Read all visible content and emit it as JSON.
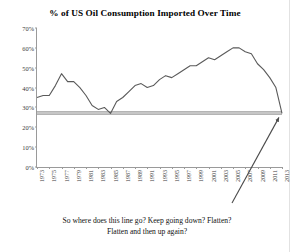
{
  "chart_data": {
    "type": "line",
    "title": "% of US Oil Consumption Imported Over Time",
    "xlabel": "",
    "ylabel": "",
    "ylim": [
      0,
      70
    ],
    "yticks": [
      0,
      10,
      20,
      30,
      40,
      50,
      60,
      70
    ],
    "ytick_labels": [
      "0%",
      "10%",
      "20%",
      "30%",
      "40%",
      "50%",
      "60%",
      "70%"
    ],
    "xlim": [
      1973,
      2013
    ],
    "xticks": [
      1973,
      1975,
      1977,
      1979,
      1981,
      1983,
      1985,
      1987,
      1989,
      1991,
      1993,
      1995,
      1997,
      1999,
      2001,
      2003,
      2005,
      2007,
      2009,
      2011,
      2013
    ],
    "xtick_labels": [
      "1973",
      "1975",
      "1977",
      "1979",
      "1981",
      "1983",
      "1985",
      "1987",
      "1989",
      "1991",
      "1993",
      "1995",
      "1997",
      "1999",
      "2001",
      "2003",
      "2005",
      "2007",
      "2009",
      "2011",
      "2013"
    ],
    "grid": false,
    "legend": "none",
    "series_color": "#5a5a5a",
    "x": [
      1973,
      1974,
      1975,
      1976,
      1977,
      1978,
      1979,
      1980,
      1981,
      1982,
      1983,
      1984,
      1985,
      1986,
      1987,
      1988,
      1989,
      1990,
      1991,
      1992,
      1993,
      1994,
      1995,
      1996,
      1997,
      1998,
      1999,
      2000,
      2001,
      2002,
      2003,
      2004,
      2005,
      2006,
      2007,
      2008,
      2009,
      2010,
      2011,
      2012,
      2013
    ],
    "values": [
      35,
      36,
      36,
      41,
      47,
      43,
      43,
      40,
      36,
      31,
      29,
      30,
      27,
      33,
      35,
      38,
      41,
      42,
      40,
      41,
      44,
      46,
      45,
      47,
      49,
      51,
      51,
      53,
      55,
      54,
      56,
      58,
      60,
      60,
      58,
      57,
      52,
      49,
      45,
      40,
      27
    ],
    "annotations": [
      {
        "text": "So where does this line go?  Keep going down?  Flatten?",
        "text2": "Flatten and then up again?",
        "arrow_from": [
          2005,
          3
        ],
        "arrow_to": [
          2013,
          27
        ]
      }
    ],
    "shaded_band": {
      "y_from": 26,
      "y_to": 28,
      "color": "#c6c6c6"
    }
  },
  "annotation": {
    "line1": "So where does this line go?  Keep going down?  Flatten?",
    "line2": "Flatten and then up again?"
  }
}
